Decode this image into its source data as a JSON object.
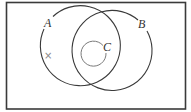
{
  "diagram": {
    "type": "venn",
    "colors": {
      "frame": "#3a3a3a",
      "circle_a": "#3a3a3a",
      "circle_b": "#3a3a3a",
      "circle_c": "#7a7a7a",
      "mark": "#8a8a8a",
      "background": "#ffffff"
    },
    "universal_set": {
      "label": ""
    },
    "sets": [
      {
        "id": "A",
        "label": "A"
      },
      {
        "id": "B",
        "label": "B"
      },
      {
        "id": "C",
        "label": "C",
        "subset_of": [
          "A",
          "B"
        ]
      }
    ],
    "marker": {
      "symbol": "×",
      "region": "A only"
    }
  }
}
